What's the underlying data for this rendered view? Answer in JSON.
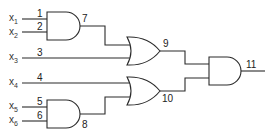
{
  "diagram": {
    "type": "logic-circuit",
    "inputs": [
      {
        "name": "x",
        "sub": "1",
        "wire_label": "1"
      },
      {
        "name": "x",
        "sub": "2",
        "wire_label": "2"
      },
      {
        "name": "x",
        "sub": "3",
        "wire_label": "3"
      },
      {
        "name": "x",
        "sub": "4",
        "wire_label": "4"
      },
      {
        "name": "x",
        "sub": "5",
        "wire_label": "5"
      },
      {
        "name": "x",
        "sub": "6",
        "wire_label": "6"
      }
    ],
    "gates": [
      {
        "id": "7",
        "type": "AND",
        "inputs": [
          "1",
          "2"
        ]
      },
      {
        "id": "8",
        "type": "AND",
        "inputs": [
          "5",
          "6"
        ]
      },
      {
        "id": "9",
        "type": "OR",
        "inputs": [
          "7",
          "3"
        ]
      },
      {
        "id": "10",
        "type": "OR",
        "inputs": [
          "4",
          "8"
        ]
      },
      {
        "id": "11",
        "type": "AND",
        "inputs": [
          "9",
          "10"
        ]
      }
    ],
    "output": "11"
  }
}
